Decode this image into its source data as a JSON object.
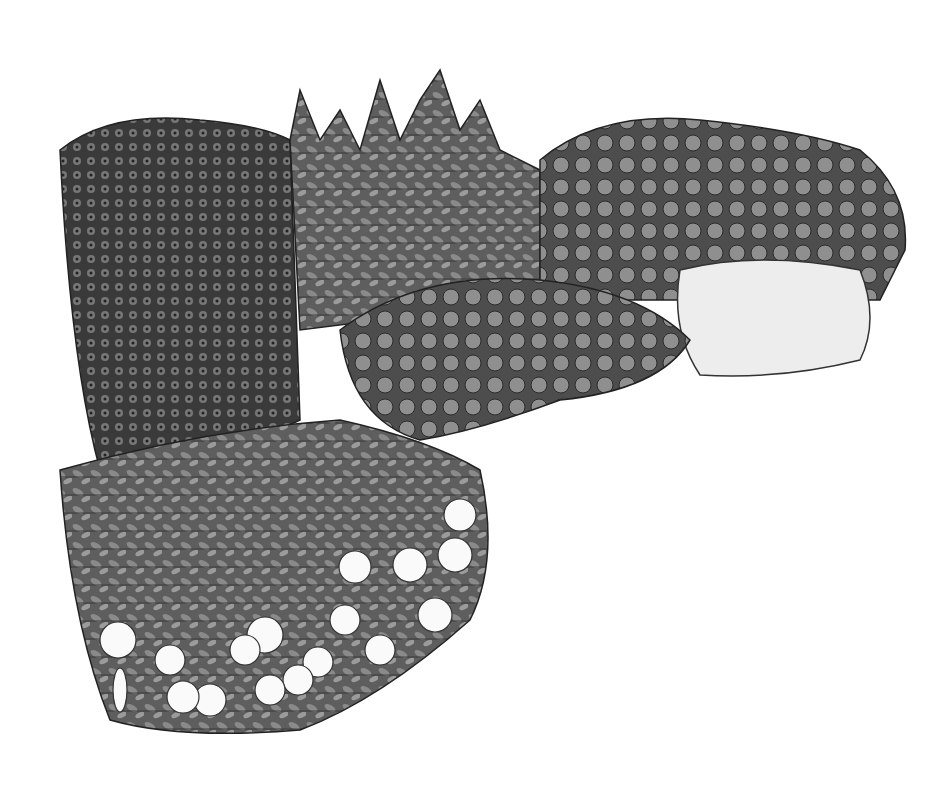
{
  "image": {
    "description": "Grayscale illustration of an L-shaped flower garden bed",
    "width": 938,
    "height": 802,
    "background": "#ffffff",
    "regions": [
      {
        "name": "tall-spires",
        "label": "Tall spiky flower spires",
        "tone": "#6a6a6a"
      },
      {
        "name": "daisy-cluster",
        "label": "Daisy-like flowers (left back)",
        "tone": "#808080"
      },
      {
        "name": "round-blooms-right",
        "label": "Round clustered blooms (right back)",
        "tone": "#7a7a7a"
      },
      {
        "name": "white-star-flowers",
        "label": "Small white star flowers (right)",
        "tone": "#f4f4f4"
      },
      {
        "name": "broad-leaf-mound",
        "label": "Broad leafy mound (center)",
        "tone": "#9a9a9a"
      },
      {
        "name": "palmate-foliage",
        "label": "Palmate foliage (front left)",
        "tone": "#707070"
      },
      {
        "name": "white-petunias",
        "label": "White petunia-like flowers (front edge)",
        "tone": "#fafafa"
      }
    ]
  }
}
